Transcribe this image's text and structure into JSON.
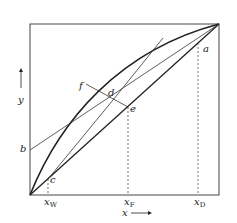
{
  "diagram": {
    "type": "McCabe-Thiele x-y diagram",
    "axes": {
      "x_label": "x",
      "y_label": "y",
      "x_arrow": "right",
      "y_arrow": "up"
    },
    "points": {
      "a": "a",
      "b": "b",
      "c": "c",
      "d": "d",
      "e": "e",
      "f": "f"
    },
    "ticks": {
      "xW": {
        "main": "x",
        "sub": "W"
      },
      "xF": {
        "main": "x",
        "sub": "F"
      },
      "xD": {
        "main": "x",
        "sub": "D"
      }
    },
    "curves": [
      "equilibrium-curve",
      "diagonal-y-equals-x",
      "rectifying-operating-line-b-a",
      "stripping-operating-line-c-d",
      "q-line-f-d-e"
    ],
    "colors": {
      "line": "#222222",
      "background": "#ffffff"
    }
  }
}
